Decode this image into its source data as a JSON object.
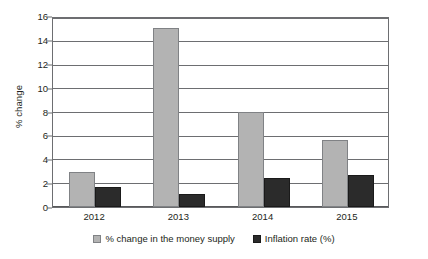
{
  "chart_data": {
    "type": "bar",
    "title": "",
    "subtitle": "",
    "xlabel": "",
    "ylabel": "% change",
    "categories": [
      "2012",
      "2013",
      "2014",
      "2015"
    ],
    "series": [
      {
        "name": "% change in the money supply",
        "values": [
          2.9,
          15.0,
          8.0,
          5.6
        ],
        "color": "#b3b3b3"
      },
      {
        "name": "Inflation rate (%)",
        "values": [
          1.7,
          1.1,
          2.4,
          2.7
        ],
        "color": "#2b2b2b"
      }
    ],
    "ylim": [
      0,
      16
    ],
    "ytick_step": 2,
    "yticks": [
      "0",
      "2",
      "4",
      "6",
      "8",
      "10",
      "12",
      "14",
      "16"
    ],
    "grid": true,
    "legend_position": "bottom"
  },
  "axes": {
    "y_title": "% change"
  },
  "legend": {
    "entries": [
      {
        "label": "% change in the money supply",
        "swatch": "legend-swatch-money-supply"
      },
      {
        "label": "Inflation rate (%)",
        "swatch": "legend-swatch-inflation"
      }
    ]
  },
  "colors": {
    "money_supply": "#b3b3b3",
    "inflation": "#2b2b2b",
    "axis": "#6d6e71",
    "text": "#231f20",
    "background": "#ffffff"
  }
}
